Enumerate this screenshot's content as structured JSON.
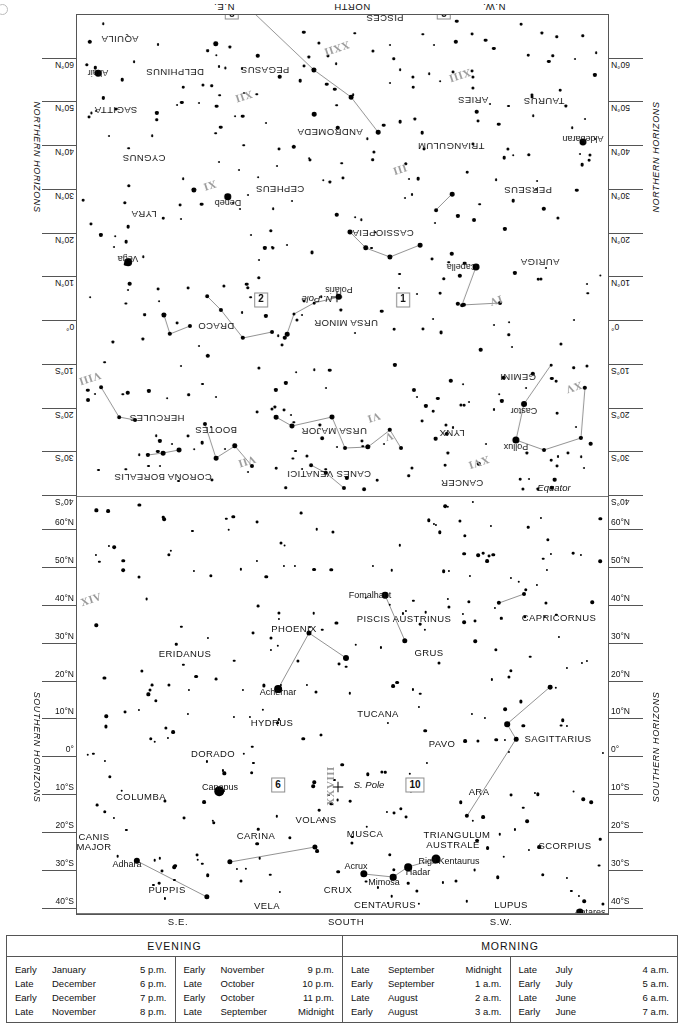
{
  "chart": {
    "equator_label": "Equator",
    "north_pole_label": "N. Pole",
    "south_pole_label": "S. Pole",
    "northern_caption": "NORTHERN HORIZONS",
    "southern_caption": "SOUTHERN HORIZONS",
    "compass": {
      "north_ne": "N.E.",
      "north_n": "NORTH",
      "north_nw": "N.W.",
      "south_se": "S.E.",
      "south_s": "SOUTH",
      "south_sw": "S.W."
    },
    "scale_labels": [
      "60°N",
      "50°N",
      "40°N",
      "30°N",
      "20°N",
      "10°N",
      "0°",
      "10°S",
      "20°S",
      "30°S",
      "40°S"
    ],
    "boxed_numbers": [
      "1",
      "2",
      "3",
      "8",
      "6",
      "10"
    ],
    "roman_numerals": [
      "V",
      "VI",
      "VII",
      "VIII",
      "XI",
      "XII",
      "XIII",
      "XIV",
      "XV",
      "XVI",
      "XXI",
      "XXII",
      "XXIII",
      "XXIV",
      "XXVIII"
    ]
  },
  "constellations_north": [
    {
      "name": "CANCER",
      "x": 222,
      "y": 26
    },
    {
      "name": "LYNX",
      "x": 232,
      "y": 76
    },
    {
      "name": "GEMINI",
      "x": 166,
      "y": 132
    },
    {
      "name": "URSA MAJOR",
      "x": 350,
      "y": 78
    },
    {
      "name": "CANES VENATICI",
      "x": 355,
      "y": 35
    },
    {
      "name": "CORONA BOREALIS",
      "x": 521,
      "y": 32
    },
    {
      "name": "BOOTES",
      "x": 468,
      "y": 79
    },
    {
      "name": "HERCULES",
      "x": 527,
      "y": 91
    },
    {
      "name": "URSA MINOR",
      "x": 338,
      "y": 186
    },
    {
      "name": "DRACO",
      "x": 468,
      "y": 183
    },
    {
      "name": "AURIGA",
      "x": 144,
      "y": 247
    },
    {
      "name": "CASSIOPEIA",
      "x": 301,
      "y": 276
    },
    {
      "name": "CEPHEUS",
      "x": 404,
      "y": 320
    },
    {
      "name": "LYRA",
      "x": 540,
      "y": 295
    },
    {
      "name": "CYGNUS",
      "x": 540,
      "y": 351
    },
    {
      "name": "PERSEUS",
      "x": 156,
      "y": 319
    },
    {
      "name": "TRIANGULUM",
      "x": 233,
      "y": 363
    },
    {
      "name": "ANDROMEDA",
      "x": 354,
      "y": 377
    },
    {
      "name": "TAURUS",
      "x": 140,
      "y": 408
    },
    {
      "name": "ARIES",
      "x": 211,
      "y": 409
    },
    {
      "name": "SAGITTA",
      "x": 568,
      "y": 399
    },
    {
      "name": "PEGASUS",
      "x": 419,
      "y": 439
    },
    {
      "name": "DELPHINUS",
      "x": 509,
      "y": 437
    },
    {
      "name": "AQUILA",
      "x": 564,
      "y": 470
    },
    {
      "name": "PISCES",
      "x": 299,
      "y": 491
    },
    {
      "name": "AQUARIUS",
      "x": 436,
      "y": 523
    },
    {
      "name": "CETUS",
      "x": 283,
      "y": 566
    }
  ],
  "constellations_south": [
    {
      "name": "PISCIS AUSTRINUS",
      "x": 403,
      "y": 617
    },
    {
      "name": "CAPRICORNUS",
      "x": 558,
      "y": 616
    },
    {
      "name": "PHOENIX",
      "x": 293,
      "y": 627
    },
    {
      "name": "ERIDANUS",
      "x": 184,
      "y": 652
    },
    {
      "name": "GRUS",
      "x": 428,
      "y": 651
    },
    {
      "name": "HYDRUS",
      "x": 271,
      "y": 721
    },
    {
      "name": "TUCANA",
      "x": 377,
      "y": 712
    },
    {
      "name": "SAGITTARIUS",
      "x": 557,
      "y": 737
    },
    {
      "name": "DORADO",
      "x": 212,
      "y": 752
    },
    {
      "name": "PAVO",
      "x": 441,
      "y": 742
    },
    {
      "name": "ARA",
      "x": 478,
      "y": 790
    },
    {
      "name": "COLUMBA",
      "x": 140,
      "y": 795
    },
    {
      "name": "VOLANS",
      "x": 315,
      "y": 818
    },
    {
      "name": "CARINA",
      "x": 255,
      "y": 834
    },
    {
      "name": "MUSCA",
      "x": 364,
      "y": 832
    },
    {
      "name": "TRIANGULUM",
      "x": 456,
      "y": 833
    },
    {
      "name": "AUSTRALE",
      "x": 452,
      "y": 843
    },
    {
      "name": "SCORPIUS",
      "x": 564,
      "y": 844
    },
    {
      "name": "CANIS",
      "x": 93,
      "y": 835
    },
    {
      "name": "MAJOR",
      "x": 93,
      "y": 845
    },
    {
      "name": "CRUX",
      "x": 337,
      "y": 888
    },
    {
      "name": "PUPPIS",
      "x": 166,
      "y": 888
    },
    {
      "name": "CENTAURUS",
      "x": 384,
      "y": 903
    },
    {
      "name": "LUPUS",
      "x": 510,
      "y": 903
    },
    {
      "name": "VELA",
      "x": 266,
      "y": 904
    }
  ],
  "named_stars_north": [
    {
      "name": "Pollux",
      "x": 168,
      "y": 63
    },
    {
      "name": "Castor",
      "x": 160,
      "y": 99
    },
    {
      "name": "Capella",
      "x": 222,
      "y": 243
    },
    {
      "name": "Vega",
      "x": 556,
      "y": 251
    },
    {
      "name": "Deneb",
      "x": 456,
      "y": 307
    },
    {
      "name": "Aldebaran",
      "x": 101,
      "y": 371
    },
    {
      "name": "Altair",
      "x": 586,
      "y": 437
    },
    {
      "name": "Polaris",
      "x": 345,
      "y": 220
    },
    {
      "name": "Mira",
      "x": 208,
      "y": 509
    }
  ],
  "named_stars_south": [
    {
      "name": "Fomalhaut",
      "x": 369,
      "y": 594
    },
    {
      "name": "Achernar",
      "x": 277,
      "y": 691
    },
    {
      "name": "Canopus",
      "x": 219,
      "y": 786
    },
    {
      "name": "Adhara",
      "x": 126,
      "y": 863
    },
    {
      "name": "Acrux",
      "x": 355,
      "y": 865
    },
    {
      "name": "Mimosa",
      "x": 383,
      "y": 881
    },
    {
      "name": "Hadar",
      "x": 417,
      "y": 871
    },
    {
      "name": "Rigil Kentaurus",
      "x": 448,
      "y": 860
    },
    {
      "name": "Antares",
      "x": 589,
      "y": 911
    }
  ],
  "legend": {
    "evening_title": "EVENING",
    "morning_title": "MORNING",
    "columns": [
      {
        "rows": [
          {
            "when": "Early",
            "month": "January",
            "time": "5 p.m."
          },
          {
            "when": "Late",
            "month": "December",
            "time": "6 p.m."
          },
          {
            "when": "Early",
            "month": "December",
            "time": "7 p.m."
          },
          {
            "when": "Late",
            "month": "November",
            "time": "8 p.m."
          }
        ]
      },
      {
        "rows": [
          {
            "when": "Early",
            "month": "November",
            "time": "9 p.m."
          },
          {
            "when": "Late",
            "month": "October",
            "time": "10 p.m."
          },
          {
            "when": "Early",
            "month": "October",
            "time": "11 p.m."
          },
          {
            "when": "Late",
            "month": "September",
            "time": "Midnight"
          }
        ]
      },
      {
        "rows": [
          {
            "when": "Late",
            "month": "September",
            "time": "Midnight"
          },
          {
            "when": "Early",
            "month": "September",
            "time": "1 a.m."
          },
          {
            "when": "Late",
            "month": "August",
            "time": "2 a.m."
          },
          {
            "when": "Early",
            "month": "August",
            "time": "3 a.m."
          }
        ]
      },
      {
        "rows": [
          {
            "when": "Late",
            "month": "July",
            "time": "4 a.m."
          },
          {
            "when": "Early",
            "month": "July",
            "time": "5 a.m."
          },
          {
            "when": "Late",
            "month": "June",
            "time": "6 a.m."
          },
          {
            "when": "Early",
            "month": "June",
            "time": "7 a.m."
          }
        ]
      }
    ]
  },
  "chart_data": {
    "type": "scatter",
    "xlabel": "Azimuth (N.E. – NORTH – N.W. / S.E. – SOUTH – S.W.)",
    "ylabel": "Declination",
    "ylim": [
      -40,
      60
    ],
    "grid": true,
    "legend_position": "bottom",
    "panels": [
      "NORTHERN HORIZONS (inverted)",
      "SOUTHERN HORIZONS"
    ],
    "tick_labels": [
      "60°N",
      "50°N",
      "40°N",
      "30°N",
      "20°N",
      "10°N",
      "0°",
      "10°S",
      "20°S",
      "30°S",
      "40°S"
    ],
    "annotations": [
      "Equator",
      "N. Pole",
      "S. Pole",
      "Polaris"
    ],
    "stars_north": [
      {
        "x": 168,
        "y": 70,
        "m": 1.1
      },
      {
        "x": 160,
        "y": 106,
        "m": 1.6
      },
      {
        "x": 140,
        "y": 60,
        "m": 3.0
      },
      {
        "x": 103,
        "y": 72,
        "m": 3.2
      },
      {
        "x": 99,
        "y": 122,
        "m": 3.3
      },
      {
        "x": 127,
        "y": 97,
        "m": 3.6
      },
      {
        "x": 133,
        "y": 145,
        "m": 3.5
      },
      {
        "x": 205,
        "y": 46,
        "m": 3.4
      },
      {
        "x": 239,
        "y": 45,
        "m": 3.6
      },
      {
        "x": 236,
        "y": 57,
        "m": 3.9
      },
      {
        "x": 238,
        "y": 85,
        "m": 3.8
      },
      {
        "x": 258,
        "y": 104,
        "m": 3.2
      },
      {
        "x": 283,
        "y": 62,
        "m": 3.0
      },
      {
        "x": 294,
        "y": 80,
        "m": 3.4
      },
      {
        "x": 307,
        "y": 30,
        "m": 3.5
      },
      {
        "x": 320,
        "y": 21,
        "m": 2.9
      },
      {
        "x": 339,
        "y": 62,
        "m": 3.0
      },
      {
        "x": 352,
        "y": 93,
        "m": 2.4
      },
      {
        "x": 270,
        "y": 120,
        "m": 3.1
      },
      {
        "x": 289,
        "y": 145,
        "m": 3.2
      },
      {
        "x": 316,
        "y": 63,
        "m": 2.6
      },
      {
        "x": 340,
        "y": 22,
        "m": 3.1
      },
      {
        "x": 358,
        "y": 37,
        "m": 3.3
      },
      {
        "x": 373,
        "y": 45,
        "m": 2.9
      },
      {
        "x": 362,
        "y": 72,
        "m": 2.8
      },
      {
        "x": 392,
        "y": 84,
        "m": 2.4
      },
      {
        "x": 408,
        "y": 93,
        "m": 2.2
      },
      {
        "x": 432,
        "y": 44,
        "m": 3.1
      },
      {
        "x": 449,
        "y": 64,
        "m": 2.7
      },
      {
        "x": 468,
        "y": 52,
        "m": 2.2
      },
      {
        "x": 479,
        "y": 86,
        "m": 3.1
      },
      {
        "x": 505,
        "y": 60,
        "m": 2.3
      },
      {
        "x": 521,
        "y": 57,
        "m": 2.2
      },
      {
        "x": 536,
        "y": 55,
        "m": 3.2
      },
      {
        "x": 549,
        "y": 90,
        "m": 3.0
      },
      {
        "x": 565,
        "y": 93,
        "m": 2.8
      },
      {
        "x": 583,
        "y": 123,
        "m": 2.9
      },
      {
        "x": 596,
        "y": 110,
        "m": 3.0
      },
      {
        "x": 345,
        "y": 213,
        "m": 2.0
      },
      {
        "x": 370,
        "y": 207,
        "m": 3.5
      },
      {
        "x": 390,
        "y": 196,
        "m": 3.8
      },
      {
        "x": 397,
        "y": 176,
        "m": 2.1
      },
      {
        "x": 412,
        "y": 178,
        "m": 3.0
      },
      {
        "x": 441,
        "y": 172,
        "m": 3.3
      },
      {
        "x": 463,
        "y": 200,
        "m": 3.1
      },
      {
        "x": 477,
        "y": 214,
        "m": 2.8
      },
      {
        "x": 494,
        "y": 184,
        "m": 3.1
      },
      {
        "x": 514,
        "y": 176,
        "m": 3.3
      },
      {
        "x": 520,
        "y": 195,
        "m": 2.5
      },
      {
        "x": 184,
        "y": 207,
        "m": 3.0
      },
      {
        "x": 222,
        "y": 205,
        "m": 2.9
      },
      {
        "x": 208,
        "y": 243,
        "m": 0.9
      },
      {
        "x": 264,
        "y": 265,
        "m": 2.2
      },
      {
        "x": 294,
        "y": 253,
        "m": 2.5
      },
      {
        "x": 318,
        "y": 262,
        "m": 2.7
      },
      {
        "x": 334,
        "y": 278,
        "m": 2.4
      },
      {
        "x": 347,
        "y": 295,
        "m": 3.4
      },
      {
        "x": 556,
        "y": 248,
        "m": 0.1
      },
      {
        "x": 456,
        "y": 313,
        "m": 1.3
      },
      {
        "x": 490,
        "y": 320,
        "m": 2.5
      },
      {
        "x": 210,
        "y": 290,
        "m": 3.0
      },
      {
        "x": 232,
        "y": 316,
        "m": 2.1
      },
      {
        "x": 248,
        "y": 300,
        "m": 2.9
      },
      {
        "x": 101,
        "y": 368,
        "m": 1.0
      },
      {
        "x": 306,
        "y": 378,
        "m": 2.1
      },
      {
        "x": 370,
        "y": 396,
        "m": 2.1
      },
      {
        "x": 333,
        "y": 413,
        "m": 2.2
      },
      {
        "x": 370,
        "y": 440,
        "m": 2.5
      },
      {
        "x": 468,
        "y": 466,
        "m": 2.7
      },
      {
        "x": 586,
        "y": 437,
        "m": 0.8
      },
      {
        "x": 430,
        "y": 497,
        "m": 3.0
      },
      {
        "x": 336,
        "y": 549,
        "m": 3.1
      }
    ],
    "stars_south": [
      {
        "x": 384,
        "y": 594,
        "m": 1.2
      },
      {
        "x": 277,
        "y": 688,
        "m": 0.5
      },
      {
        "x": 218,
        "y": 790,
        "m": -0.7
      },
      {
        "x": 136,
        "y": 860,
        "m": 1.5
      },
      {
        "x": 363,
        "y": 873,
        "m": 0.8
      },
      {
        "x": 392,
        "y": 876,
        "m": 1.3
      },
      {
        "x": 407,
        "y": 866,
        "m": 0.6
      },
      {
        "x": 435,
        "y": 858,
        "m": -0.3
      },
      {
        "x": 579,
        "y": 911,
        "m": 1.0
      },
      {
        "x": 308,
        "y": 632,
        "m": 2.4
      },
      {
        "x": 345,
        "y": 657,
        "m": 1.7
      },
      {
        "x": 404,
        "y": 640,
        "m": 2.1
      },
      {
        "x": 498,
        "y": 602,
        "m": 2.9
      },
      {
        "x": 523,
        "y": 593,
        "m": 3.1
      },
      {
        "x": 549,
        "y": 686,
        "m": 2.6
      },
      {
        "x": 506,
        "y": 723,
        "m": 2.0
      },
      {
        "x": 515,
        "y": 738,
        "m": 2.7
      },
      {
        "x": 466,
        "y": 815,
        "m": 2.9
      },
      {
        "x": 229,
        "y": 861,
        "m": 2.2
      },
      {
        "x": 314,
        "y": 846,
        "m": 2.3
      },
      {
        "x": 206,
        "y": 896,
        "m": 2.2
      }
    ]
  }
}
